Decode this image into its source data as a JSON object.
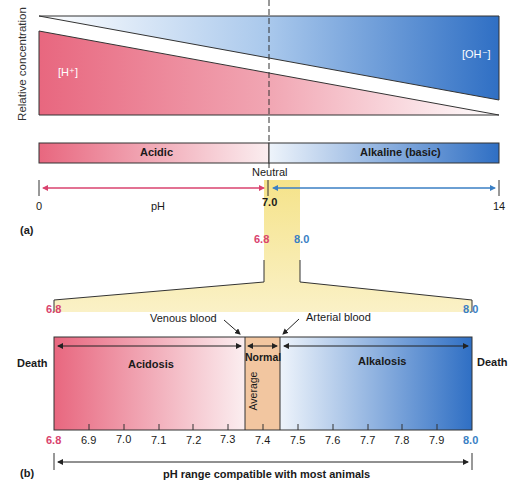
{
  "panel_a": {
    "label": "(a)",
    "y_axis_label": "Relative concentration",
    "h_ion_label": "[H⁺]",
    "oh_ion_label": "[OH⁻]",
    "acidic_label": "Acidic",
    "alkaline_label": "Alkaline (basic)",
    "neutral_label": "Neutral",
    "ph_label": "pH",
    "ph_min": "0",
    "ph_max": "14",
    "ph_neutral": "7.0",
    "zoom_low": "6.8",
    "zoom_high": "8.0"
  },
  "panel_b": {
    "label": "(b)",
    "range_low": "6.8",
    "range_high": "8.0",
    "venous_label": "Venous blood",
    "arterial_label": "Arterial blood",
    "death_left": "Death",
    "death_right": "Death",
    "acidosis_label": "Acidosis",
    "normal_label": "Normal",
    "average_label": "Average",
    "alkalosis_label": "Alkalosis",
    "ticks": [
      "6.8",
      "6.9",
      "7.0",
      "7.1",
      "7.2",
      "7.3",
      "7.4",
      "7.5",
      "7.6",
      "7.7",
      "7.8",
      "7.9",
      "8.0"
    ],
    "range_caption": "pH range compatible with most animals"
  },
  "colors": {
    "acid_red": "#e8677f",
    "base_blue": "#2f6fc4",
    "highlight_yellow": "#f7e8a0",
    "normal_orange": "#f2c6a0",
    "label_pink": "#d9436e",
    "label_blue": "#3a7fc4"
  }
}
